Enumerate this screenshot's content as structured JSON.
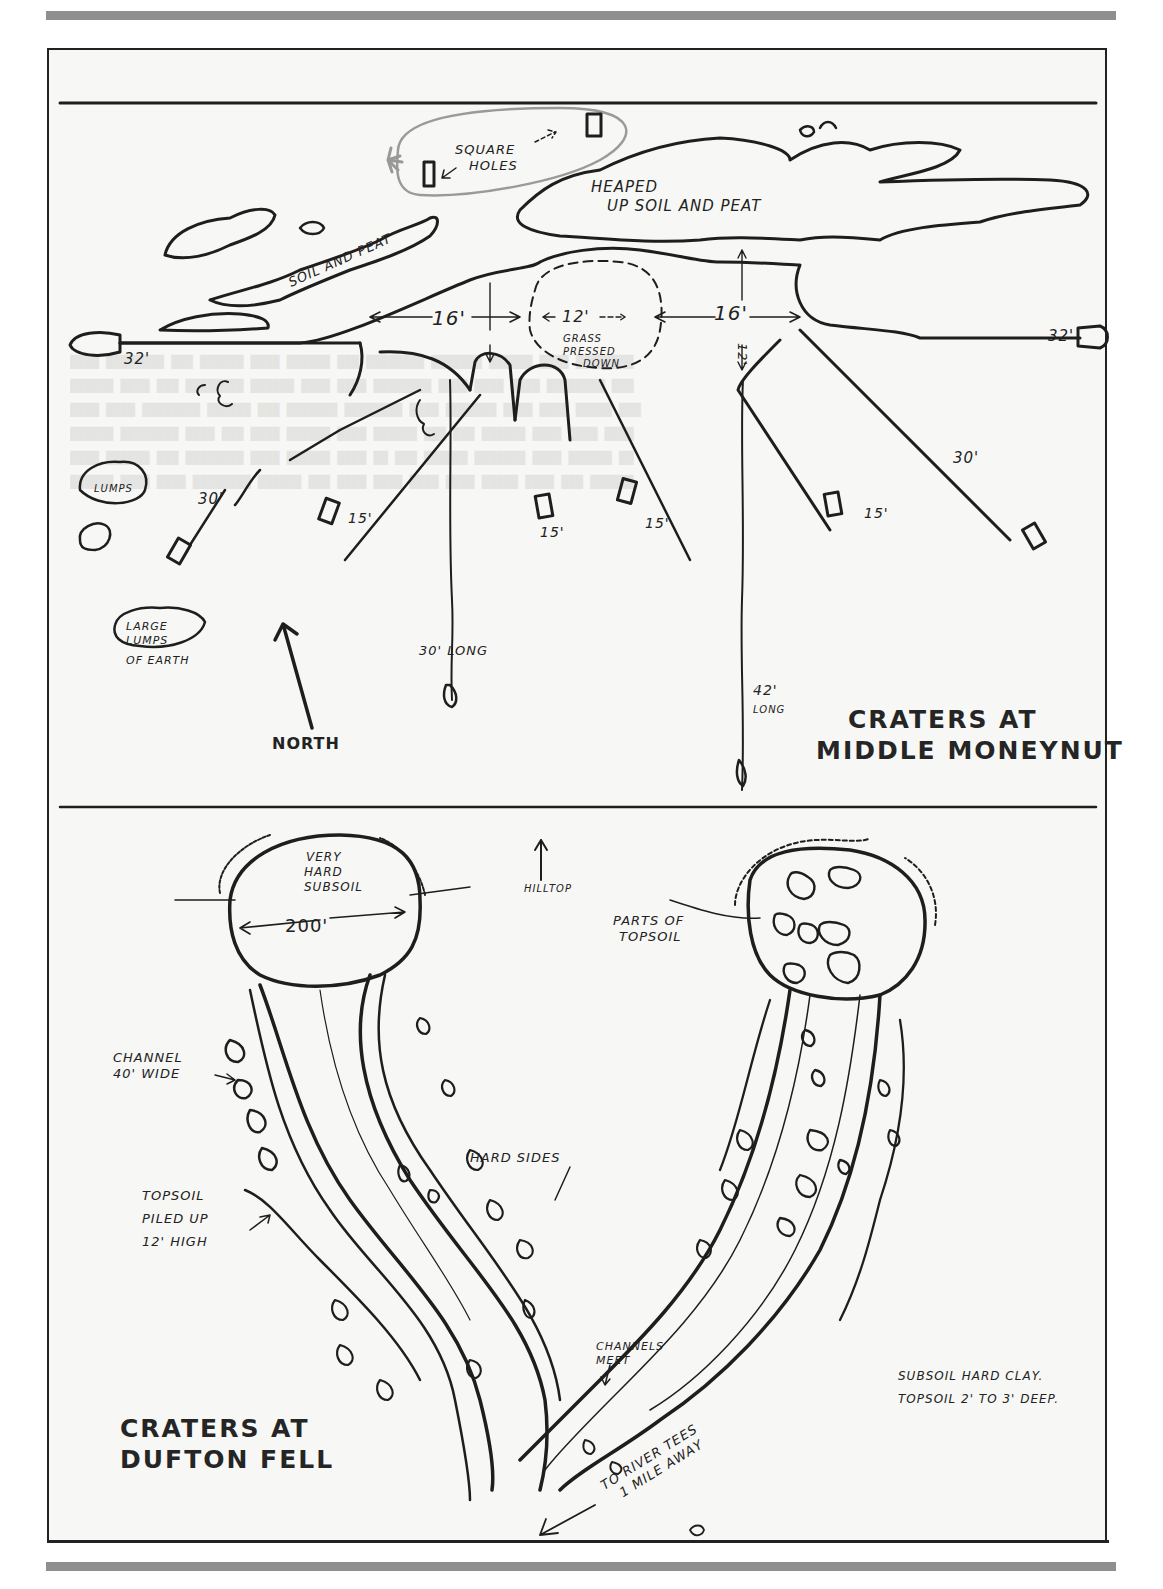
{
  "page": {
    "rules": {
      "color": "#8f8f8f"
    },
    "frame": {
      "border_color": "#222222",
      "background": "#f7f7f5"
    }
  },
  "panel_top": {
    "title_line1": "CRATERS AT",
    "title_line2": "MIDDLE MONEYNUT",
    "labels": {
      "square_holes_1": "SQUARE",
      "square_holes_2": "HOLES",
      "heaped_1": "HEAPED",
      "heaped_2": "UP SOIL AND PEAT",
      "soil_and_peat": "SOIL AND PEAT",
      "dim_left_16": "16'",
      "dim_right_16": "16'",
      "dim_center_12": "12'",
      "dim_vertical_12": "12'",
      "grass_1": "GRASS",
      "grass_2": "PRESSED",
      "grass_3": "DOWN",
      "left_32": "32'",
      "right_32": "32'",
      "lumps": "LUMPS",
      "left_30": "30'",
      "right_30": "30'",
      "ray_15_a": "15'",
      "ray_15_b": "15'",
      "ray_15_c": "15'",
      "ray_15_d": "15'",
      "large_1": "LARGE",
      "large_2": "LUMPS",
      "large_3": "OF EARTH",
      "long_30": "30' LONG",
      "long_42_1": "42'",
      "long_42_2": "LONG",
      "north": "NORTH"
    },
    "icons": [
      "north-arrow-icon",
      "dimension-arrow-icon",
      "square-hole-icon",
      "highlight-marker-icon"
    ]
  },
  "panel_bottom": {
    "title_line1": "CRATERS AT",
    "title_line2": "DUFTON FELL",
    "labels": {
      "very_hard_1": "VERY",
      "very_hard_2": "HARD",
      "very_hard_3": "SUBSOIL",
      "diameter": "200'",
      "hilltop": "HILLTOP",
      "parts_1": "PARTS OF",
      "parts_2": "TOPSOIL",
      "channel_1": "CHANNEL",
      "channel_2": "40' WIDE",
      "hard_sides": "HARD SIDES",
      "topsoil_1": "TOPSOIL",
      "topsoil_2": "PILED UP",
      "topsoil_3": "12' HIGH",
      "channels_meet_1": "CHANNELS",
      "channels_meet_2": "MEET",
      "river_1": "TO RIVER TEES",
      "river_2": "1 MILE AWAY",
      "subsoil_note": "SUBSOIL HARD CLAY.",
      "topsoil_note": "TOPSOIL 2' TO 3' DEEP."
    },
    "icons": [
      "hilltop-arrow-icon",
      "river-direction-arrow-icon"
    ]
  }
}
